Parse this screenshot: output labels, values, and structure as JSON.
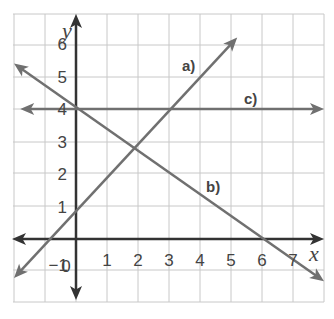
{
  "chart_data": {
    "type": "line",
    "title": "",
    "xlabel": "x",
    "ylabel": "y",
    "xlim": [
      -2,
      8
    ],
    "ylim": [
      -2,
      7
    ],
    "grid": true,
    "x_ticks": [
      "0",
      "1",
      "2",
      "3",
      "4",
      "5",
      "6",
      "7"
    ],
    "y_ticks": [
      "-1",
      "1",
      "2",
      "3",
      "4",
      "5",
      "6"
    ],
    "series": [
      {
        "name": "a)",
        "equation": "y = x + 1",
        "slope": 1,
        "intercept": 1,
        "x": [
          -2,
          5.2
        ],
        "y": [
          -1.2,
          6.2
        ]
      },
      {
        "name": "b)",
        "equation": "y = -2/3 x + 4",
        "slope": -0.6667,
        "intercept": 4,
        "x": [
          -2,
          8
        ],
        "y": [
          5.4,
          -1.3
        ]
      },
      {
        "name": "c)",
        "equation": "y = 4",
        "slope": 0,
        "intercept": 4,
        "x": [
          -1.8,
          8
        ],
        "y": [
          4,
          4
        ]
      }
    ],
    "labels": {
      "a": "a)",
      "b": "b)",
      "c": "c)"
    }
  }
}
